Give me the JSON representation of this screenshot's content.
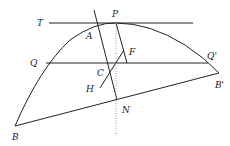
{
  "diagram": {
    "colors": {
      "stroke": "#222222",
      "dotted": "#999999",
      "background": "#ffffff"
    },
    "labels": {
      "T": "T",
      "P": "P",
      "A": "A",
      "F": "F",
      "Q": "Q",
      "Qp": "Q'",
      "C": "C",
      "H": "H",
      "Bp": "B'",
      "N": "N",
      "B": "B"
    },
    "elements": [
      "parabolic arc B-Q-A-P-Q'-B'",
      "tangent line TP",
      "chord QQ'",
      "chord BB'",
      "line through A to N",
      "line P to chord QQ'",
      "line H-F",
      "dotted diameter through P and N"
    ]
  }
}
